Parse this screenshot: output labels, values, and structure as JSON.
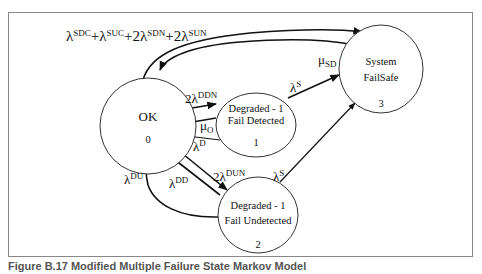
{
  "states": [
    {
      "id": 0,
      "line1": "OK",
      "line2": "",
      "number": "0"
    },
    {
      "id": 1,
      "line1": "Degraded - 1",
      "line2": "Fail Detected",
      "number": "1"
    },
    {
      "id": 2,
      "line1": "Degraded - 1",
      "line2": "Fail Undetected",
      "number": "2"
    },
    {
      "id": 3,
      "line1": "System",
      "line2": "FailSafe",
      "number": "3"
    }
  ],
  "transitions": {
    "ok_to_failsafe": {
      "base": "λ",
      "parts": [
        {
          "coef": "",
          "sup": "SDC"
        },
        {
          "coef": "+",
          "sup": "SUC"
        },
        {
          "coef": "+2",
          "sup": "SDN"
        },
        {
          "coef": "+2",
          "sup": "SUN"
        }
      ]
    },
    "failsafe_to_ok": {
      "base": "μ",
      "sub": "SD"
    },
    "ok_to_1": {
      "coef": "2",
      "base": "λ",
      "sup": "DDN"
    },
    "one_to_ok_repair": {
      "base": "μ",
      "sub": "O"
    },
    "one_to_ok_d": {
      "base": "λ",
      "sup": "D"
    },
    "one_to_failsafe": {
      "base": "λ",
      "sup": "S"
    },
    "ok_to_2": {
      "coef": "2",
      "base": "λ",
      "sup": "DUN"
    },
    "two_to_ok_dd": {
      "base": "λ",
      "sup": "DD"
    },
    "two_to_ok_du": {
      "base": "λ",
      "sup": "DU"
    },
    "two_to_failsafe": {
      "base": "λ",
      "sup": "S"
    }
  },
  "caption": "Figure B.17 Modified Multiple Failure State Markov Model"
}
